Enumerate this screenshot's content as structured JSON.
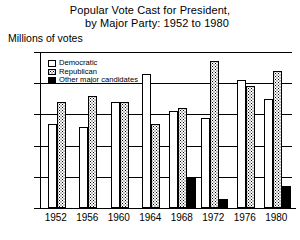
{
  "chart_data": {
    "type": "bar",
    "title": "Popular Vote Cast for President,\nby Major Party: 1952 to 1980",
    "title_line_1": "Popular Vote Cast for President,",
    "title_line_2": "by Major Party: 1952 to 1980",
    "ylabel": "Millions of votes",
    "xlabel": "",
    "ylim": [
      0,
      50
    ],
    "yticks": [
      50,
      40,
      30,
      20,
      10,
      0
    ],
    "ytick_labels": [
      "50",
      "40",
      "30",
      "20",
      "10",
      "0"
    ],
    "grid": true,
    "legend_position": "upper-left",
    "categories": [
      "1952",
      "1956",
      "1960",
      "1964",
      "1968",
      "1972",
      "1976",
      "1980"
    ],
    "series": [
      {
        "name": "Democratic",
        "swatch": "white-open",
        "color": "#ffffff",
        "values": [
          27,
          26,
          34,
          43,
          31,
          29,
          41,
          35
        ]
      },
      {
        "name": "Republican",
        "swatch": "stippled",
        "color": "#ffffff",
        "values": [
          34,
          36,
          34,
          27,
          32,
          47,
          39,
          44
        ]
      },
      {
        "name": "Other major candidates",
        "swatch": "solid-black",
        "color": "#000000",
        "values": [
          0,
          0,
          0,
          0,
          10,
          3,
          0,
          7
        ]
      }
    ],
    "legend": [
      "Democratic",
      "Republican",
      "Other major candidates"
    ]
  }
}
